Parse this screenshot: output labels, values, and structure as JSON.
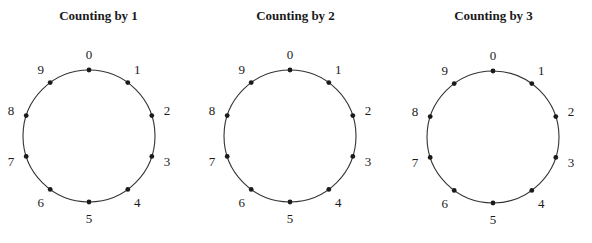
{
  "panels": [
    {
      "title": "Counting by 1",
      "cx": 89,
      "cy": 136,
      "r": 66
    },
    {
      "title": "Counting by 2",
      "cx": 290,
      "cy": 136,
      "r": 66
    },
    {
      "title": "Counting by 3",
      "cx": 493,
      "cy": 137,
      "r": 66
    }
  ],
  "labels": [
    "0",
    "1",
    "2",
    "3",
    "4",
    "5",
    "6",
    "7",
    "8",
    "9"
  ],
  "colors": {
    "stroke": "#333333",
    "dot": "#1a1a1a",
    "text": "#1a1a1a"
  }
}
